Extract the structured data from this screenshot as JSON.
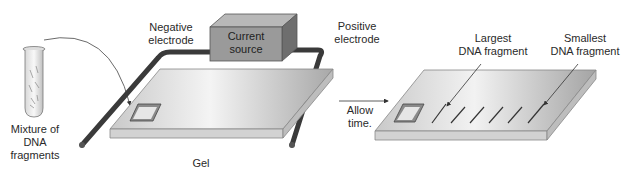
{
  "labels": {
    "mixture_line1": "Mixture of",
    "mixture_line2": "DNA",
    "mixture_line3": "fragments",
    "negative_line1": "Negative",
    "negative_line2": "electrode",
    "current_line1": "Current",
    "current_line2": "source",
    "positive_line1": "Positive",
    "positive_line2": "electrode",
    "gel": "Gel",
    "allow_line1": "Allow",
    "allow_line2": "time.",
    "largest_line1": "Largest",
    "largest_line2": "DNA fragment",
    "smallest_line1": "Smallest",
    "smallest_line2": "DNA fragment"
  },
  "colors": {
    "gel_top": "#d9d9d9",
    "gel_side": "#c4c4c4",
    "box_front": "#9a9a9a",
    "box_top": "#b8b8b8",
    "box_side": "#6e6e6e",
    "electrode": "#3a3a3a",
    "text": "#2a2a2a"
  },
  "bands_count": 6
}
